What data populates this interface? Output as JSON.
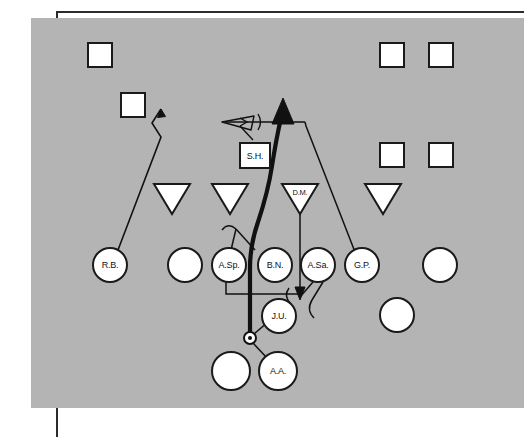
{
  "diagram": {
    "field_color": "#b4b4b4",
    "ink_color": "#111111",
    "shape_fill": "#ffffff",
    "frame_color": "#2b2b2b"
  },
  "defense_squares": [
    {
      "name": "square-1",
      "label": "",
      "x": 100,
      "y": 55
    },
    {
      "name": "square-2",
      "label": "",
      "x": 133,
      "y": 105
    },
    {
      "name": "square-3",
      "label": "",
      "x": 392,
      "y": 55
    },
    {
      "name": "square-4",
      "label": "",
      "x": 441,
      "y": 55
    },
    {
      "name": "square-5",
      "label": "",
      "x": 392,
      "y": 155
    },
    {
      "name": "square-6",
      "label": "",
      "x": 441,
      "y": 155
    }
  ],
  "labeled_square": {
    "name": "square-sh",
    "label": "S.H.",
    "x": 255,
    "y": 156
  },
  "triangles": [
    {
      "name": "triangle-1",
      "label": "",
      "x": 172,
      "y": 195
    },
    {
      "name": "triangle-2",
      "label": "",
      "x": 230,
      "y": 195
    },
    {
      "name": "triangle-3",
      "label": "D.M.",
      "x": 300,
      "y": 195
    },
    {
      "name": "triangle-4",
      "label": "",
      "x": 383,
      "y": 195
    }
  ],
  "offense_circles": [
    {
      "name": "circle-rb",
      "label": "R.B.",
      "x": 110,
      "y": 265
    },
    {
      "name": "circle-blank-1",
      "label": "",
      "x": 185,
      "y": 265
    },
    {
      "name": "circle-asp",
      "label": "A.Sp.",
      "x": 229,
      "y": 265
    },
    {
      "name": "circle-bn",
      "label": "B.N.",
      "x": 275,
      "y": 265
    },
    {
      "name": "circle-asa",
      "label": "A.Sa.",
      "x": 318,
      "y": 265
    },
    {
      "name": "circle-gp",
      "label": "G.P.",
      "x": 362,
      "y": 265
    },
    {
      "name": "circle-blank-2",
      "label": "",
      "x": 440,
      "y": 265
    },
    {
      "name": "circle-ju",
      "label": "J.U.",
      "x": 279,
      "y": 316
    },
    {
      "name": "circle-blank-3",
      "label": "",
      "x": 397,
      "y": 315
    },
    {
      "name": "circle-blank-4",
      "label": "",
      "x": 231,
      "y": 371
    },
    {
      "name": "circle-aa",
      "label": "A.A.",
      "x": 278,
      "y": 371
    }
  ],
  "ball_marker": {
    "name": "ball-marker",
    "x": 250,
    "y": 338
  },
  "routes": {
    "rb_route": "R.B. vertical release to deep left",
    "main_ball_path": "Ball carrier path upfield through the middle",
    "sh_motion": "S.H. lateral motion to the left",
    "gp_pull": "G.P. pull to the right deep",
    "asp_block": "A.Sp. block assignment",
    "asa_block": "A.Sa. block assignment",
    "dm_blitz": "D.M. downhill blitz"
  }
}
